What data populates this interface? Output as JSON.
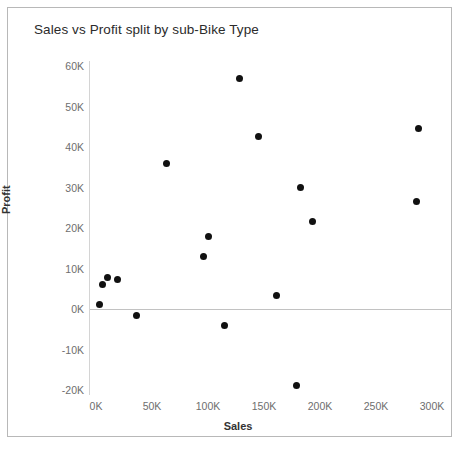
{
  "chart_data": {
    "type": "scatter",
    "title": "Sales vs Profit split by sub-Bike Type",
    "xlabel": "Sales",
    "ylabel": "Profit",
    "xlim": [
      -6000,
      325000
    ],
    "ylim": [
      -24000,
      62000
    ],
    "x_ticks": [
      {
        "value": 0,
        "label": "0K"
      },
      {
        "value": 50000,
        "label": "50K"
      },
      {
        "value": 100000,
        "label": "100K"
      },
      {
        "value": 150000,
        "label": "150K"
      },
      {
        "value": 200000,
        "label": "200K"
      },
      {
        "value": 250000,
        "label": "250K"
      },
      {
        "value": 300000,
        "label": "300K"
      }
    ],
    "y_ticks": [
      {
        "value": 60000,
        "label": "60K"
      },
      {
        "value": 50000,
        "label": "50K"
      },
      {
        "value": 40000,
        "label": "40K"
      },
      {
        "value": 30000,
        "label": "30K"
      },
      {
        "value": 20000,
        "label": "20K"
      },
      {
        "value": 10000,
        "label": "10K"
      },
      {
        "value": 0,
        "label": "0K"
      },
      {
        "value": -10000,
        "label": "-10K"
      },
      {
        "value": -20000,
        "label": "-20K"
      }
    ],
    "grid": false,
    "legend": "none",
    "reference_line": {
      "axis": "y",
      "value": 0
    },
    "marker": {
      "shape": "circle",
      "color": "#111111",
      "size": 7
    },
    "points": [
      {
        "x": 3000,
        "y": 1000
      },
      {
        "x": 6000,
        "y": 6000
      },
      {
        "x": 10000,
        "y": 7800
      },
      {
        "x": 19000,
        "y": 7300
      },
      {
        "x": 36000,
        "y": -1500
      },
      {
        "x": 63000,
        "y": 36000
      },
      {
        "x": 96000,
        "y": 13000
      },
      {
        "x": 100000,
        "y": 18000
      },
      {
        "x": 115000,
        "y": -4000
      },
      {
        "x": 128000,
        "y": 57000
      },
      {
        "x": 145000,
        "y": 42500
      },
      {
        "x": 183000,
        "y": 30000
      },
      {
        "x": 161000,
        "y": 3300
      },
      {
        "x": 193000,
        "y": 21500
      },
      {
        "x": 179000,
        "y": -19000
      },
      {
        "x": 288000,
        "y": 44500
      },
      {
        "x": 286000,
        "y": 26500
      }
    ]
  },
  "axes": {
    "x_title": "Sales",
    "y_title": "Profit"
  }
}
